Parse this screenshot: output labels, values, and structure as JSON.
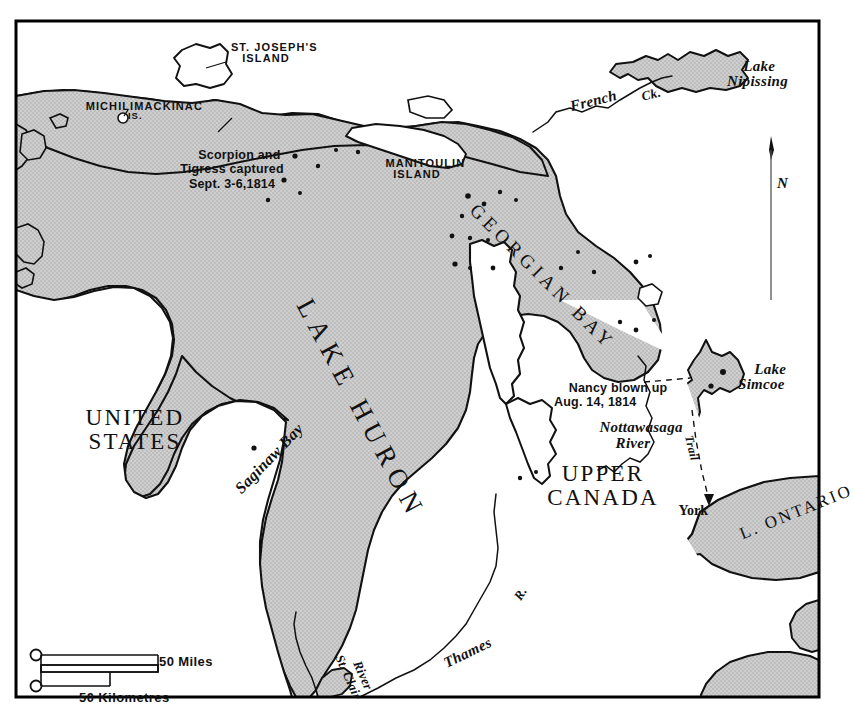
{
  "map": {
    "title_regions": [
      {
        "id": "united-states",
        "label": "UNITED\nSTATES"
      },
      {
        "id": "upper-canada",
        "label": "UPPER\nCANADA"
      }
    ],
    "water_bodies": [
      {
        "id": "lake-huron",
        "label": "LAKE HURON"
      },
      {
        "id": "georgian-bay",
        "label": "GEORGIAN BAY"
      },
      {
        "id": "lake-nipissing",
        "label": "Lake\nNipissing"
      },
      {
        "id": "lake-simcoe",
        "label": "Lake\nSimcoe"
      },
      {
        "id": "lake-ontario",
        "label": "L. ONTARIO"
      },
      {
        "id": "saginaw-bay",
        "label": "Saginaw Bay"
      }
    ],
    "islands": [
      {
        "id": "st-josephs-island",
        "label": "ST. JOSEPH'S\nISLAND"
      },
      {
        "id": "michilimackinac-is",
        "label": "MICHILIMACKINAC",
        "sub": "IS."
      },
      {
        "id": "manitoulin-island",
        "label": "MANITOULIN\nISLAND"
      }
    ],
    "rivers": [
      {
        "id": "french-ck",
        "label": "French",
        "label2": "Ck."
      },
      {
        "id": "nottawasaga-river",
        "label": "Nottawasaga\nRiver"
      },
      {
        "id": "st-clair-river",
        "label": "St. Clair",
        "label2": "River"
      },
      {
        "id": "thames-river",
        "label": "Thames",
        "label2": "R."
      }
    ],
    "cities": [
      {
        "id": "york",
        "label": "York"
      }
    ],
    "routes": [
      {
        "id": "trail",
        "label": "Trail"
      }
    ],
    "events": [
      {
        "id": "scorpion-tigress",
        "label": "Scorpion and\nTigress captured\nSept. 3-6,1814"
      },
      {
        "id": "nancy-blown-up",
        "label": "Nancy blown up\nAug. 14, 1814"
      }
    ],
    "compass": {
      "label": "N"
    },
    "scale_bar": {
      "miles_label": "50 Miles",
      "kilometres_label": "50 Kilometres"
    },
    "colors": {
      "water_fill": "#c9c9c9",
      "land_fill": "#ffffff",
      "ink": "#111111",
      "frame": "#000000"
    }
  }
}
